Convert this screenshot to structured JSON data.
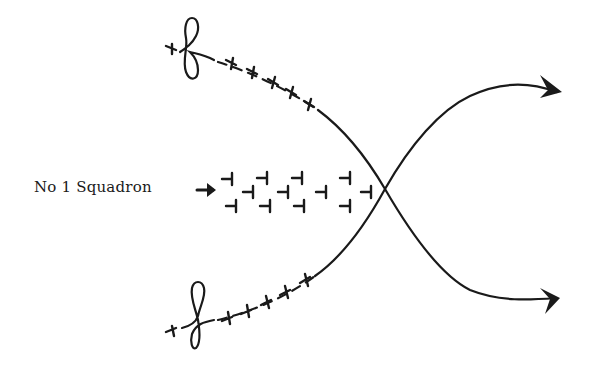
{
  "diagram": {
    "type": "tactical-flight-diagram",
    "colors": {
      "ink": "#1a1a1a",
      "background": "#ffffff"
    },
    "squadron_label": "No  1 Squadron",
    "label_arrow": "right-arrow-icon",
    "crossing_point": [
      385,
      189
    ],
    "formation": {
      "name": "No 1 Squadron formation",
      "aircraft_count": 12,
      "direction": "right",
      "aircraft": [
        {
          "x": 228,
          "y": 179
        },
        {
          "x": 263,
          "y": 178
        },
        {
          "x": 298,
          "y": 178
        },
        {
          "x": 346,
          "y": 178
        },
        {
          "x": 249,
          "y": 192
        },
        {
          "x": 284,
          "y": 192
        },
        {
          "x": 322,
          "y": 192
        },
        {
          "x": 367,
          "y": 192
        },
        {
          "x": 232,
          "y": 206
        },
        {
          "x": 266,
          "y": 206
        },
        {
          "x": 300,
          "y": 206
        },
        {
          "x": 346,
          "y": 206
        }
      ]
    },
    "upper_flight": {
      "name": "upper flight path",
      "start_loop": [
        193,
        50
      ],
      "aircraft": [
        {
          "x": 172,
          "y": 48
        },
        {
          "x": 232,
          "y": 63
        },
        {
          "x": 253,
          "y": 72
        },
        {
          "x": 274,
          "y": 82
        },
        {
          "x": 292,
          "y": 92
        },
        {
          "x": 310,
          "y": 104
        }
      ],
      "ends_at_arrow": [
        560,
        205
      ],
      "arrow_direction": "right"
    },
    "lower_flight": {
      "name": "lower flight path",
      "start_loop": [
        196,
        318
      ],
      "aircraft": [
        {
          "x": 172,
          "y": 330
        },
        {
          "x": 228,
          "y": 319
        },
        {
          "x": 247,
          "y": 312
        },
        {
          "x": 267,
          "y": 302
        },
        {
          "x": 286,
          "y": 292
        },
        {
          "x": 306,
          "y": 280
        }
      ],
      "ends_at_arrow": [
        560,
        92
      ],
      "arrow_direction": "right"
    }
  }
}
